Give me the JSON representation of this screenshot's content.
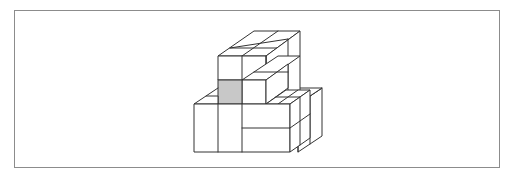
{
  "figure": {
    "type": "isometric-cube-stack",
    "shaded_face_color": "#c8c8c8",
    "line_color": "#333333",
    "frame_color": "#8c8c8c",
    "background": "#ffffff"
  }
}
